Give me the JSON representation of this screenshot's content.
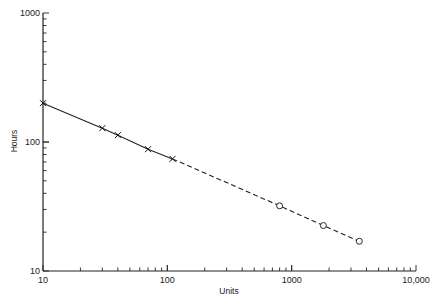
{
  "chart_data": {
    "type": "line",
    "title": "",
    "xlabel": "Units",
    "ylabel": "Hours",
    "xscale": "log",
    "yscale": "log",
    "xlim": [
      10,
      10000
    ],
    "ylim": [
      10,
      1000
    ],
    "grid": false,
    "legend": null,
    "x_tick_labels": [
      "10",
      "100",
      "1000",
      "10,000"
    ],
    "y_tick_labels": [
      "10",
      "100",
      "1000"
    ],
    "series": [
      {
        "name": "observed",
        "marker": "x",
        "line": "solid",
        "x": [
          10,
          30,
          40,
          70,
          110
        ],
        "y": [
          200,
          128,
          113,
          88,
          74
        ]
      },
      {
        "name": "extrapolated",
        "marker": "o",
        "line": "dashed",
        "x": [
          110,
          800,
          1800,
          3500
        ],
        "y": [
          74,
          32,
          22.5,
          17
        ]
      }
    ]
  }
}
